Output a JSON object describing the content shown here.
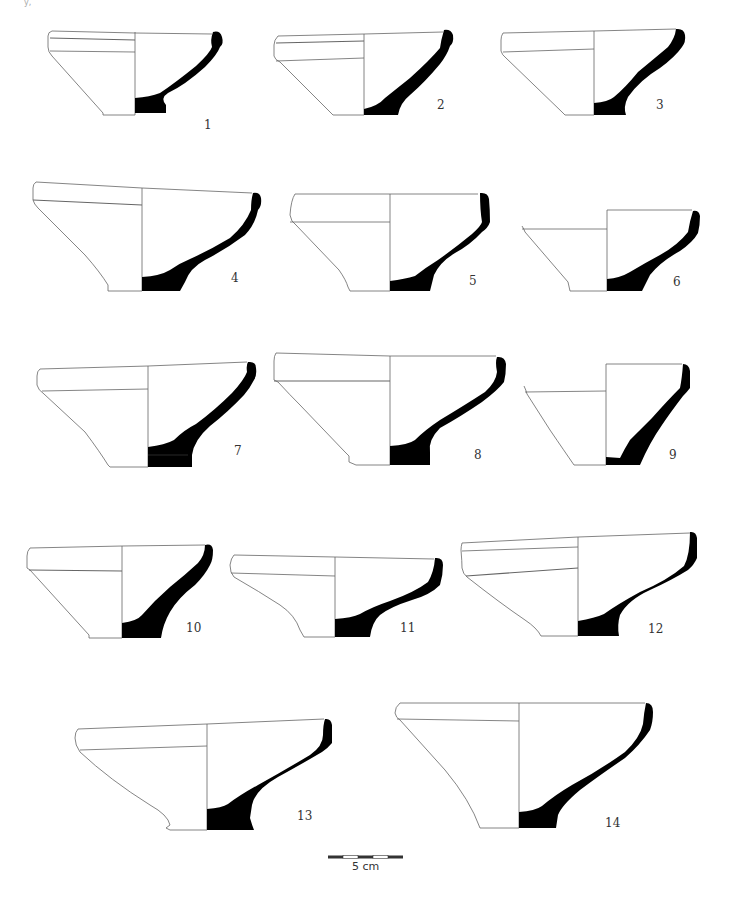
{
  "figure": {
    "type": "archaeological pottery profile plate",
    "background": "#ffffff",
    "section_fill": "#000000",
    "line_color": "#555555",
    "corner_mark": "y,",
    "vessel_count": 14
  },
  "vessels": [
    {
      "number": "1",
      "label_pos": [
        207,
        124
      ]
    },
    {
      "number": "2",
      "label_pos": [
        437,
        103
      ]
    },
    {
      "number": "3",
      "label_pos": [
        657,
        103
      ]
    },
    {
      "number": "4",
      "label_pos": [
        232,
        276
      ]
    },
    {
      "number": "5",
      "label_pos": [
        469,
        278
      ]
    },
    {
      "number": "6",
      "label_pos": [
        673,
        279
      ]
    },
    {
      "number": "7",
      "label_pos": [
        235,
        448
      ]
    },
    {
      "number": "8",
      "label_pos": [
        475,
        453
      ]
    },
    {
      "number": "9",
      "label_pos": [
        669,
        452
      ]
    },
    {
      "number": "10",
      "label_pos": [
        189,
        626
      ]
    },
    {
      "number": "11",
      "label_pos": [
        401,
        626
      ]
    },
    {
      "number": "12",
      "label_pos": [
        649,
        627
      ]
    },
    {
      "number": "13",
      "label_pos": [
        297,
        812
      ]
    },
    {
      "number": "14",
      "label_pos": [
        605,
        821
      ]
    }
  ],
  "scale_bar": {
    "label": "5 cm",
    "segments": 5,
    "x_start": 328,
    "x_end": 403,
    "y": 857
  }
}
